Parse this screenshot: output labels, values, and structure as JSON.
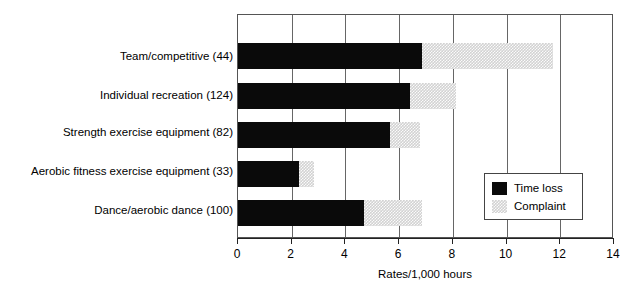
{
  "chart_data": {
    "type": "bar",
    "orientation": "horizontal",
    "title": "",
    "xlabel": "Rates/1,000 hours",
    "ylabel": "",
    "xlim": [
      0,
      14
    ],
    "xticks": [
      0,
      2,
      4,
      6,
      8,
      10,
      12,
      14
    ],
    "xtick_labels": [
      "0",
      "2",
      "4",
      "6",
      "8",
      "10",
      "12",
      "14"
    ],
    "grid": true,
    "grid_axis": "x",
    "stacked": true,
    "legend_position": "lower-right-inside",
    "categories": [
      "Team/competitive (44)",
      "Individual recreation (124)",
      "Strength exercise equipment (82)",
      "Aerobic fitness exercise equipment (33)",
      "Dance/aerobic dance (100)"
    ],
    "series": [
      {
        "name": "Time loss",
        "color": "#0a0a0a",
        "values": [
          6.9,
          6.45,
          5.7,
          2.3,
          4.7
        ]
      },
      {
        "name": "Complaint",
        "color": "#d2d2d2",
        "values": [
          4.9,
          1.7,
          1.1,
          0.55,
          2.2
        ]
      }
    ],
    "totals": [
      11.8,
      8.15,
      6.8,
      2.85,
      6.9
    ]
  },
  "legend": {
    "entries": [
      {
        "label": "Time loss",
        "swatch": "solid-black-swatch"
      },
      {
        "label": "Complaint",
        "swatch": "hatched-gray-swatch"
      }
    ]
  },
  "axis": {
    "x_title": "Rates/1,000 hours",
    "tick_labels": [
      "0",
      "2",
      "4",
      "6",
      "8",
      "10",
      "12",
      "14"
    ]
  },
  "category_labels": [
    "Team/competitive (44)",
    "Individual recreation (124)",
    "Strength exercise equipment (82)",
    "Aerobic fitness exercise equipment (33)",
    "Dance/aerobic dance (100)"
  ]
}
